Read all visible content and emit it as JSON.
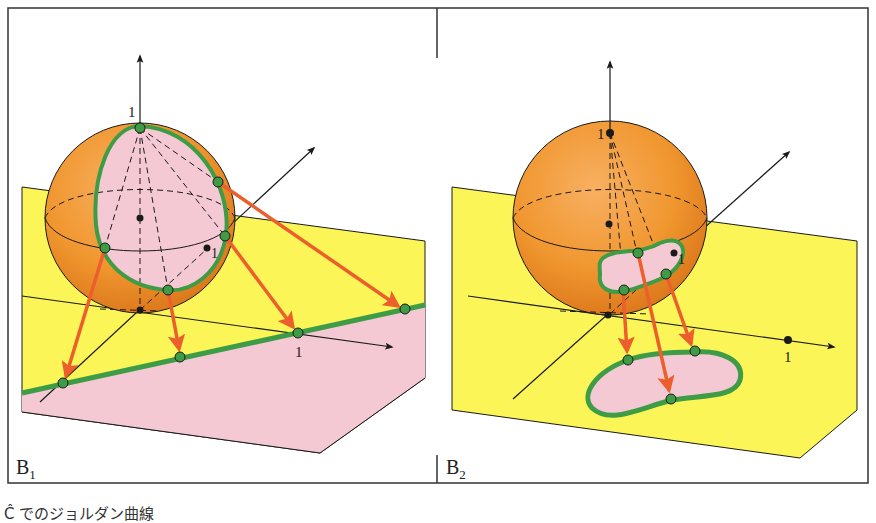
{
  "figure": {
    "panels": [
      {
        "id": "B1",
        "label_main": "B",
        "label_sub": "1",
        "axis_labels": {
          "z_tick": "1",
          "y_tick": "1",
          "x_tick": "1"
        }
      },
      {
        "id": "B2",
        "label_main": "B",
        "label_sub": "2",
        "axis_labels": {
          "z_tick": "1",
          "y_tick": "1",
          "x_tick": "1"
        }
      }
    ],
    "caption": "Ĉ でのジョルダン曲線"
  },
  "colors": {
    "sphere_orange": "#f0962e",
    "sphere_dark": "#d9741a",
    "plane_yellow": "#fbf557",
    "region_pink": "#f4c9d3",
    "curve_green": "#3f9c46",
    "arrow_red": "#ec5f2c",
    "line_black": "#1a1a1a",
    "border": "#333333"
  }
}
